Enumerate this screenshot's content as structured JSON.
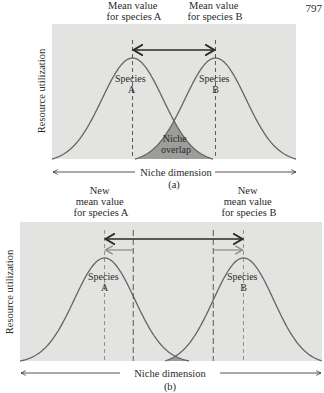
{
  "page_number": "797",
  "colors": {
    "panel_bg": "#e3e3e1",
    "curve": "#6a6462",
    "overlap_fill": "#9d9d9b",
    "dashed_line": "#4a4a4a",
    "dark_arrow": "#2a2a2a",
    "gray_arrow": "#8a8a8a"
  },
  "panel_a": {
    "caption": "(a)",
    "y_axis_label": "Resource utilization",
    "x_axis_label": "Niche dimension",
    "mean_label_a": [
      "Mean value",
      "for species A"
    ],
    "mean_label_b": [
      "Mean value",
      "for species B"
    ],
    "species_a": [
      "Species",
      "A"
    ],
    "species_b": [
      "Species",
      "B"
    ],
    "overlap_label": [
      "Niche",
      "overlap"
    ],
    "mean_a": 0.33,
    "mean_b": 0.67,
    "spread": 0.125
  },
  "panel_b": {
    "caption": "(b)",
    "y_axis_label": "Resource utilization",
    "x_axis_label": "Niche dimension",
    "mean_label_a": [
      "New",
      "mean value",
      "for species A"
    ],
    "mean_label_b": [
      "New",
      "mean value",
      "for species B"
    ],
    "species_a": [
      "Species",
      "A"
    ],
    "species_b": [
      "Species",
      "B"
    ],
    "old_mean_a": 0.375,
    "old_mean_b": 0.64,
    "new_mean_a": 0.28,
    "new_mean_b": 0.74,
    "spread": 0.1
  }
}
